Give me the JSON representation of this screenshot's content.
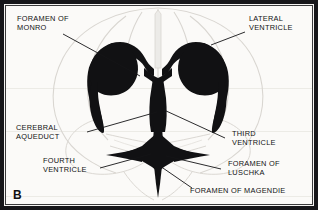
{
  "figure": {
    "panel_label": "B",
    "background_color": "#fbfaf8",
    "ink_color": "#111113",
    "ghost_outline_color": "#d7d4cf",
    "frame_color": "#16161a"
  },
  "labels": {
    "foramen_of_monro": "FORAMEN OF\nMONRO",
    "lateral_ventricle": "LATERAL\nVENTRICLE",
    "cerebral_aqueduct": "CEREBRAL\nAQUEDUCT",
    "third_ventricle": "THIRD\nVENTRICLE",
    "fourth_ventricle": "FOURTH\nVENTRICLE",
    "foramen_of_luschka": "FORAMEN OF\nLUSCHKA",
    "foramen_of_magendie": "FORAMEN OF MAGENDIE"
  },
  "structures": [
    {
      "name": "left-lateral-ventricle",
      "label_key": "lateral_ventricle"
    },
    {
      "name": "right-lateral-ventricle",
      "label_key": "lateral_ventricle"
    },
    {
      "name": "third-ventricle",
      "label_key": "third_ventricle"
    },
    {
      "name": "cerebral-aqueduct",
      "label_key": "cerebral_aqueduct"
    },
    {
      "name": "fourth-ventricle",
      "label_key": "fourth_ventricle"
    },
    {
      "name": "foramen-of-monro",
      "label_key": "foramen_of_monro"
    },
    {
      "name": "foramen-of-luschka",
      "label_key": "foramen_of_luschka"
    },
    {
      "name": "foramen-of-magendie",
      "label_key": "foramen_of_magendie"
    }
  ]
}
